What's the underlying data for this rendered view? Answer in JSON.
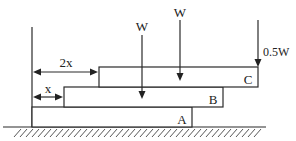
{
  "figure": {
    "type": "stacked-blocks-statics",
    "blocks": [
      {
        "id": "A",
        "label": "A"
      },
      {
        "id": "B",
        "label": "B"
      },
      {
        "id": "C",
        "label": "C"
      }
    ],
    "dimensions": [
      {
        "id": "offset-b",
        "label": "x"
      },
      {
        "id": "offset-c",
        "label": "2x"
      }
    ],
    "loads": [
      {
        "id": "load-on-b",
        "label": "W",
        "on_block": "B"
      },
      {
        "id": "load-on-c",
        "label": "W",
        "on_block": "C"
      },
      {
        "id": "load-end-c",
        "label": "0.5W",
        "on_block": "C"
      }
    ],
    "ground": {
      "label": ""
    }
  }
}
